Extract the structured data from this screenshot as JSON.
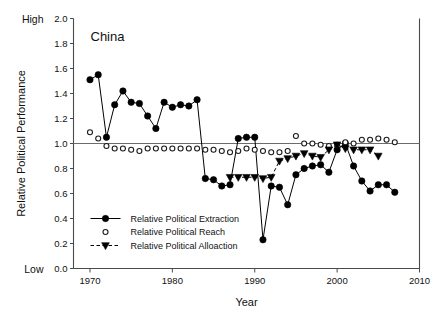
{
  "figure": {
    "panel_title": "China",
    "high_label": "High",
    "low_label": "Low",
    "xlabel": "Year",
    "ylabel": "Relative Political Performance"
  },
  "legend": {
    "items": [
      {
        "label": "Relative Political Extraction",
        "marker": "filled-circle",
        "line": "solid"
      },
      {
        "label": "Relative Political Reach",
        "marker": "open-circle",
        "line": "none"
      },
      {
        "label": "Relative Political Alloaction",
        "marker": "filled-triangle-down",
        "line": "dashed"
      }
    ]
  },
  "axes": {
    "x_ticks": [
      "1970",
      "1980",
      "1990",
      "2000",
      "2010"
    ],
    "y_ticks": [
      "0.0",
      "0.2",
      "0.4",
      "0.6",
      "0.8",
      "1.0",
      "1.2",
      "1.4",
      "1.6",
      "1.8",
      "2.0"
    ]
  },
  "colors": {
    "ink": "#000000",
    "axis": "#4a4a4a",
    "reference": "#6b6b6b",
    "background": "#ffffff"
  },
  "chart_data": {
    "type": "line",
    "title": "China",
    "xlabel": "Year",
    "ylabel": "Relative Political Performance",
    "xlim": [
      1968,
      2010
    ],
    "ylim": [
      0.0,
      2.0
    ],
    "xticks": [
      1970,
      1980,
      1990,
      2000,
      2010
    ],
    "yticks": [
      0.0,
      0.2,
      0.4,
      0.6,
      0.8,
      1.0,
      1.2,
      1.4,
      1.6,
      1.8,
      2.0
    ],
    "grid": false,
    "legend_position": "lower-left-inside",
    "reference_line_y": 1.0,
    "annotations": [
      {
        "text": "High",
        "position": "outside-left-top"
      },
      {
        "text": "Low",
        "position": "outside-left-bottom"
      }
    ],
    "series": [
      {
        "name": "Relative Political Extraction",
        "marker": "filled-circle",
        "linestyle": "solid",
        "x": [
          1970,
          1971,
          1972,
          1973,
          1974,
          1975,
          1976,
          1977,
          1978,
          1979,
          1980,
          1981,
          1982,
          1983,
          1984,
          1985,
          1986,
          1987,
          1988,
          1989,
          1990,
          1991,
          1992,
          1993,
          1994,
          1995,
          1996,
          1997,
          1998,
          1999,
          2000,
          2001,
          2002,
          2003,
          2004,
          2005,
          2006,
          2007
        ],
        "y": [
          1.51,
          1.55,
          1.05,
          1.31,
          1.42,
          1.33,
          1.32,
          1.22,
          1.12,
          1.33,
          1.29,
          1.31,
          1.3,
          1.35,
          0.72,
          0.71,
          0.66,
          0.67,
          1.04,
          1.05,
          1.05,
          0.23,
          0.66,
          0.65,
          0.51,
          0.75,
          0.8,
          0.82,
          0.83,
          0.77,
          0.95,
          1.0,
          0.82,
          0.7,
          0.62,
          0.67,
          0.67,
          0.61
        ]
      },
      {
        "name": "Relative Political Reach",
        "marker": "open-circle",
        "linestyle": "none",
        "x": [
          1970,
          1971,
          1972,
          1973,
          1974,
          1975,
          1976,
          1977,
          1978,
          1979,
          1980,
          1981,
          1982,
          1983,
          1984,
          1985,
          1986,
          1987,
          1988,
          1989,
          1990,
          1991,
          1992,
          1993,
          1994,
          1995,
          1996,
          1997,
          1998,
          1999,
          2000,
          2001,
          2002,
          2003,
          2004,
          2005,
          2006,
          2007
        ],
        "y": [
          1.09,
          1.04,
          0.98,
          0.96,
          0.96,
          0.95,
          0.94,
          0.96,
          0.96,
          0.96,
          0.96,
          0.96,
          0.96,
          0.96,
          0.95,
          0.95,
          0.94,
          0.93,
          0.94,
          0.96,
          0.95,
          0.94,
          0.93,
          0.93,
          0.94,
          1.06,
          1.0,
          1.0,
          0.99,
          0.98,
          0.99,
          1.01,
          1.0,
          1.03,
          1.03,
          1.04,
          1.03,
          1.01
        ]
      },
      {
        "name": "Relative Political Alloaction",
        "marker": "filled-triangle-down",
        "linestyle": "dashed",
        "x": [
          1987,
          1988,
          1989,
          1990,
          1991,
          1992,
          1993,
          1994,
          1995,
          1996,
          1997,
          1998,
          1999,
          2000,
          2001,
          2002,
          2003,
          2004,
          2005
        ],
        "y": [
          0.73,
          0.73,
          0.73,
          0.73,
          0.72,
          0.73,
          0.86,
          0.88,
          0.9,
          0.92,
          0.9,
          0.89,
          0.95,
          0.99,
          0.96,
          0.95,
          0.95,
          0.95,
          0.9
        ]
      }
    ]
  }
}
